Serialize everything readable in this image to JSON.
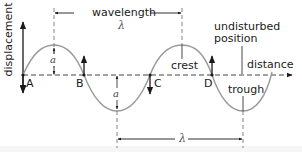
{
  "diagram": {
    "type": "transverse-wave",
    "axes": {
      "y_label": "displacement",
      "x_label": "distance"
    },
    "points": [
      {
        "id": "A",
        "label": "A"
      },
      {
        "id": "B",
        "label": "B"
      },
      {
        "id": "C",
        "label": "C"
      },
      {
        "id": "D",
        "label": "D"
      }
    ],
    "annotations": {
      "wavelength_label": "wavelength",
      "wavelength_symbol": "λ",
      "bottom_wavelength_symbol": "λ",
      "amplitude_symbol_top": "a",
      "amplitude_symbol_bottom": "a",
      "crest": "crest",
      "trough": "trough",
      "undisturbed_line1": "undisturbed",
      "undisturbed_line2": "position"
    },
    "colors": {
      "wave": "#9a9a9a",
      "axis": "#1a1a1a",
      "dashed": "#555555",
      "text": "#1a1a1a"
    }
  }
}
